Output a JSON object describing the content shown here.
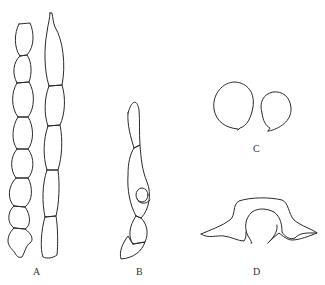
{
  "figure": {
    "panels": [
      {
        "id": "A",
        "label": "A",
        "description": "chains of conidia (two chains)"
      },
      {
        "id": "B",
        "label": "B",
        "description": "conidiophore with cells"
      },
      {
        "id": "C",
        "label": "C",
        "description": "two globose spores"
      },
      {
        "id": "D",
        "label": "D",
        "description": "cross-section appendaged structure"
      }
    ]
  }
}
